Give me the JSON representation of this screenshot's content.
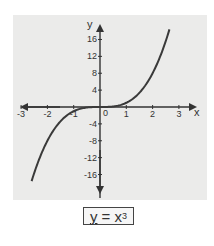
{
  "chart_data": {
    "type": "line",
    "title": "",
    "xlabel": "x",
    "ylabel": "y",
    "equation": "y = x³",
    "equation_parts": {
      "lhs": "y",
      "eq": " = ",
      "base": "x",
      "exp": "3"
    },
    "x_ticks": [
      -3,
      -2,
      -1,
      1,
      2,
      3
    ],
    "x_tick_labels": [
      "-3",
      "-2",
      "-1",
      "1",
      "2",
      "3"
    ],
    "origin_label": "0",
    "y_ticks": [
      16,
      12,
      8,
      4,
      -4,
      -8,
      -12,
      -16
    ],
    "y_tick_labels": [
      "16",
      "12",
      "8",
      "4",
      "-4",
      "-8",
      "-12",
      "-16"
    ],
    "xlim": [
      -3.2,
      3.8
    ],
    "ylim": [
      -21,
      20.5
    ],
    "grid": false,
    "legend": null,
    "series": [
      {
        "name": "y = x^3",
        "x": [
          -2.6,
          -2.4,
          -2.2,
          -2.0,
          -1.8,
          -1.6,
          -1.4,
          -1.2,
          -1.0,
          -0.8,
          -0.6,
          -0.4,
          -0.2,
          0.0,
          0.2,
          0.4,
          0.6,
          0.8,
          1.0,
          1.2,
          1.4,
          1.6,
          1.8,
          2.0,
          2.2,
          2.4,
          2.66
        ],
        "y": [
          -17.58,
          -13.82,
          -10.65,
          -8.0,
          -5.83,
          -4.1,
          -2.74,
          -1.73,
          -1.0,
          -0.51,
          -0.22,
          -0.06,
          -0.01,
          0.0,
          0.01,
          0.06,
          0.22,
          0.51,
          1.0,
          1.73,
          2.74,
          4.1,
          5.83,
          8.0,
          10.65,
          13.82,
          18.82
        ]
      }
    ],
    "colors": {
      "curve": "#3a3a3a",
      "axis": "#333333",
      "panel": "#ebebea"
    }
  }
}
